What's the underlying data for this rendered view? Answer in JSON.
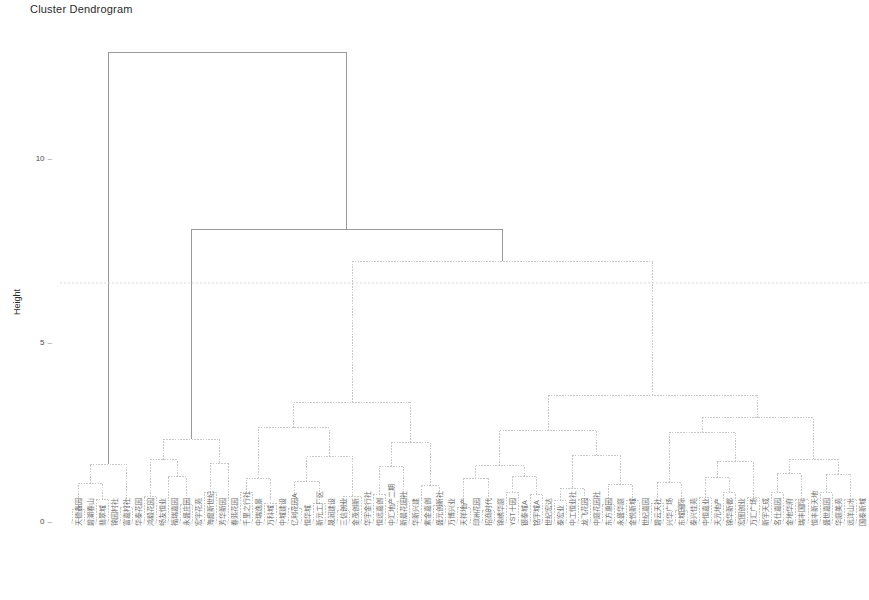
{
  "chart_data": {
    "type": "dendrogram",
    "title": "Cluster Dendrogram",
    "xlabel": "",
    "ylabel": "Height",
    "ylim": [
      0,
      13.6
    ],
    "yticks": [
      0,
      5,
      10
    ],
    "ytick_labels": [
      "0",
      "5",
      "10"
    ],
    "grid": false,
    "legend": null,
    "line_color": "#b9b9b9",
    "root_line_color": "#9a9a9a",
    "cut_line": {
      "height": 6.65,
      "style": "dashed",
      "color": "#cfcfcf"
    },
    "n_leaves": 66,
    "leaf_labels": [
      "天德鑫园",
      "碧湖春山",
      "翡翠城",
      "锦园村社",
      "富嘉村社",
      "华泰花园",
      "鸿毅花园",
      "畅友恒业",
      "福瑞嘉园",
      "永盛庄园",
      "宏宇花苑",
      "海度新世纪",
      "芳华新园",
      "春熙花园",
      "千里之行社",
      "中瑞逸景",
      "万科城",
      "中城建设",
      "亿利花园A",
      "恒华城",
      "新元工厂区",
      "晟润建设",
      "三信创业",
      "金茂创新",
      "华宇金行社",
      "恒远嘉创",
      "中汇地产二期",
      "新晨花园社",
      "华新兴建",
      "紫金嘉创",
      "盛元创新社",
      "万博兴业",
      "天祥地产",
      "印洲花园",
      "招商时代",
      "锦绣华庭",
      "YST十园",
      "银泰城A",
      "铭宇城A",
      "世纪宏达",
      "泰宏业",
      "中工恒业社",
      "龙飞花园",
      "中庭花园社",
      "东方惠园",
      "永盛华庭",
      "金悦新城",
      "世纪嘉园",
      "碧云天社",
      "兴华广场",
      "东城国际",
      "泰兴佳苑",
      "中恒嘉业",
      "天元地产",
      "锦华新都",
      "宏图创业",
      "万汇广场",
      "新宇天成",
      "名仕嘉园",
      "金地华府",
      "瑞丰国际",
      "恒丰新天地",
      "盛世嘉园",
      "华庭美苑",
      "远洋山水",
      "国泰新城"
    ],
    "leaf_x": [
      72,
      84,
      96,
      108,
      120,
      132,
      144,
      156,
      168,
      180,
      192,
      204,
      216,
      228,
      240,
      252,
      264,
      276,
      288,
      301,
      313,
      325,
      337,
      349,
      361,
      373,
      385,
      397,
      409,
      421,
      433,
      445,
      457,
      470,
      482,
      494,
      506,
      518,
      530,
      542,
      554,
      566,
      578,
      590,
      602,
      614,
      626,
      639,
      651,
      663,
      675,
      687,
      699,
      711,
      723,
      735,
      747,
      759,
      771,
      783,
      795,
      808,
      820,
      832,
      844,
      856
    ],
    "merges": [
      {
        "x1": 96,
        "x2": 205,
        "height": 13.1,
        "main": true
      },
      {
        "x1": 144,
        "x2": 265,
        "height": 8.15,
        "main": true
      },
      {
        "x1": 188,
        "x2": 343,
        "height": 7.25,
        "main": false
      },
      {
        "x1": 72,
        "x2": 112,
        "height": 6.15,
        "main": false
      },
      {
        "x1": 246,
        "x2": 443,
        "height": 4.3,
        "main": false
      },
      {
        "x1": 300,
        "x2": 575,
        "height": 3.35,
        "main": false
      },
      {
        "x1": 96,
        "x2": 130,
        "height": 1.95,
        "main": false
      },
      {
        "x1": 120,
        "x2": 141,
        "height": 0.62,
        "main": false
      },
      {
        "x1": 158,
        "x2": 210,
        "height": 1.6,
        "main": false
      },
      {
        "x1": 186,
        "x2": 228,
        "height": 0.72,
        "main": false
      },
      {
        "x1": 240,
        "x2": 252,
        "height": 2.4,
        "main": false
      },
      {
        "x1": 366,
        "x2": 520,
        "height": 2.3,
        "main": false
      },
      {
        "x1": 660,
        "x2": 796,
        "height": 1.95,
        "main": false
      },
      {
        "x1": 700,
        "x2": 830,
        "height": 1.35,
        "main": false
      }
    ]
  },
  "axis": {
    "title": "Cluster Dendrogram",
    "ylabel": "Height",
    "tick_dash": "–"
  }
}
